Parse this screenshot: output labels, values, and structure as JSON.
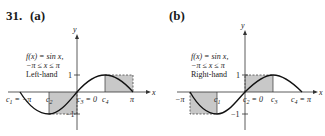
{
  "problem_number": "31.",
  "panels": [
    {
      "label": "(a)",
      "function_label": "f(x) = sin x,",
      "domain_label": "−π ≤ x ≤ π",
      "method": "Left-hand",
      "axes": {
        "x": "x",
        "y": "y"
      },
      "y_ticks": [
        "1",
        "−1"
      ],
      "x_points": [
        "c₁ = −π",
        "c₂",
        "c₃ = 0",
        "c₄",
        "π"
      ]
    },
    {
      "label": "(b)",
      "function_label": "f(x) = sin x,",
      "domain_label": "−π ≤ x ≤ π",
      "method": "Right-hand",
      "axes": {
        "x": "x",
        "y": "y"
      },
      "y_ticks": [
        "1",
        "−1"
      ],
      "x_points": [
        "−π",
        "c₁",
        "c₂ = 0",
        "c₃",
        "c₄ = π"
      ]
    }
  ],
  "colors": {
    "shade": "#c8c8c8",
    "curve": "#111111",
    "axis": "#333333"
  }
}
